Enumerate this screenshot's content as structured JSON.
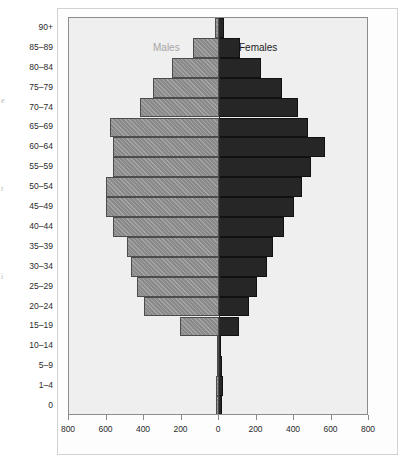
{
  "chart_data": {
    "type": "bar",
    "subtype": "population-pyramid",
    "title": "",
    "xlabel": "",
    "ylabel": "",
    "orientation": "horizontal",
    "grid": false,
    "legend_position": "inside-top",
    "axis_center_value": 0,
    "xlim": [
      -800,
      800
    ],
    "xticks": [
      -800,
      -600,
      -400,
      -200,
      0,
      200,
      400,
      600,
      800
    ],
    "xtick_labels": [
      "800",
      "600",
      "400",
      "200",
      "0",
      "200",
      "400",
      "600",
      "800"
    ],
    "categories": [
      "90+",
      "85–89",
      "80–84",
      "75–79",
      "70–74",
      "65–69",
      "60–64",
      "55–59",
      "50–54",
      "45–49",
      "40–44",
      "35–39",
      "30–34",
      "25–29",
      "20–24",
      "15–19",
      "10–14",
      "5–9",
      "1–4",
      "0"
    ],
    "series": [
      {
        "name": "Males",
        "color": "#8a8a8a",
        "side": "left",
        "values": [
          20,
          140,
          250,
          350,
          420,
          580,
          565,
          565,
          605,
          605,
          565,
          490,
          470,
          440,
          400,
          210,
          12,
          10,
          16,
          14
        ]
      },
      {
        "name": "Females",
        "color": "#262626",
        "side": "right",
        "values": [
          25,
          110,
          225,
          335,
          420,
          475,
          565,
          490,
          445,
          400,
          345,
          290,
          255,
          200,
          160,
          105,
          12,
          16,
          22,
          14
        ]
      }
    ]
  },
  "legend": {
    "males": "Males",
    "females": "Females"
  },
  "edge_glyphs": [
    {
      "text": "e",
      "top": 96
    },
    {
      "text": "r",
      "top": 184
    },
    {
      "text": "i",
      "top": 272
    }
  ]
}
